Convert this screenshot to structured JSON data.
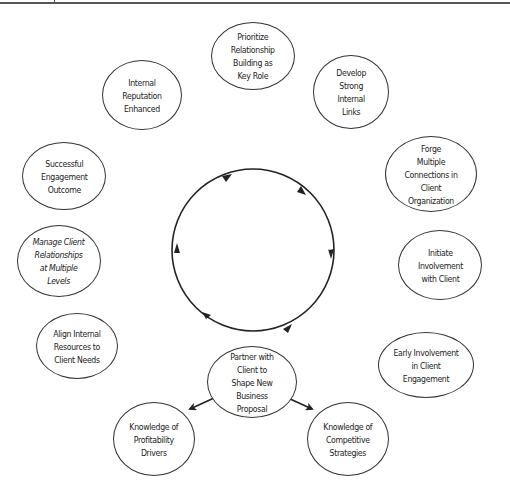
{
  "diagram": {
    "type": "cycle",
    "cycle_direction": "clockwise",
    "nodes": [
      {
        "id": "prioritize",
        "label": "Prioritize\nRelationship\nBuilding as\nKey Role"
      },
      {
        "id": "develop",
        "label": "Develop\nStrong\nInternal\nLinks"
      },
      {
        "id": "forge",
        "label": "Forge\nMultiple\nConnections in Client\nOrganization"
      },
      {
        "id": "initiate",
        "label": "Initiate\nInvolvement\nwith Client"
      },
      {
        "id": "early",
        "label": "Early Involvement\nin Client Engagement"
      },
      {
        "id": "partner",
        "label": "Partner with\nClient to\nShape New Business\nProposal"
      },
      {
        "id": "align",
        "label": "Align Internal\nResources to\nClient Needs"
      },
      {
        "id": "manage",
        "label": "Manage Client\nRelationships\nat Multiple\nLevels"
      },
      {
        "id": "successful",
        "label": "Successful\nEngagement\nOutcome"
      },
      {
        "id": "reputation",
        "label": "Internal\nReputation\nEnhanced"
      },
      {
        "id": "profitability",
        "label": "Knowledge of\nProfitability\nDrivers"
      },
      {
        "id": "competitive",
        "label": "Knowledge of\nCompetitive\nStrategies"
      }
    ],
    "edges": [
      {
        "from": "partner",
        "to": "profitability"
      },
      {
        "from": "partner",
        "to": "competitive"
      }
    ],
    "colors": {
      "stroke": "#333333",
      "text": "#222222",
      "background": "#ffffff"
    }
  }
}
